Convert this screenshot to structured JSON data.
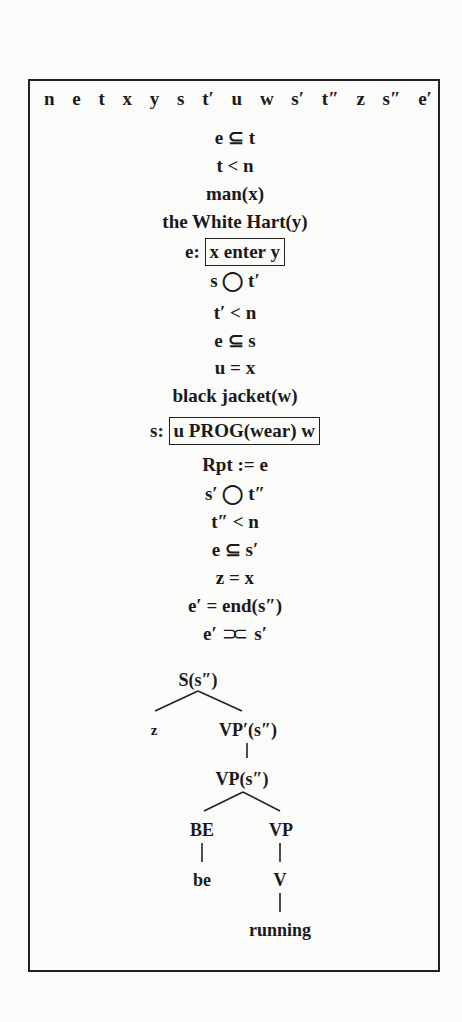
{
  "drs": {
    "universe": [
      "n",
      "e",
      "t",
      "x",
      "y",
      "s",
      "t′",
      "u",
      "w",
      "s′",
      "t″",
      "z",
      "s″",
      "e′"
    ],
    "conditions": [
      {
        "text": "e ⊆ t"
      },
      {
        "text": "t < n"
      },
      {
        "text": "man(x)"
      },
      {
        "text": "the White Hart(y)"
      },
      {
        "prefix": "e:",
        "boxed": "x enter y"
      },
      {
        "text": "s ◯ t′"
      },
      {
        "text": "t′ < n"
      },
      {
        "text": "e ⊆ s"
      },
      {
        "text": "u = x"
      },
      {
        "text": "black jacket(w)"
      },
      {
        "prefix": "s:",
        "boxed": "u PROG(wear) w"
      },
      {
        "text": "Rpt := e"
      },
      {
        "text": "s′ ◯ t″"
      },
      {
        "text": "t″ < n"
      },
      {
        "text": "e ⊆ s′"
      },
      {
        "text": "z = x"
      },
      {
        "text": "e′ = end(s″)"
      },
      {
        "left": "e′",
        "symbol": "⊃⊂",
        "right": "s′"
      }
    ],
    "tree": {
      "root": "S(s″)",
      "subject": "z",
      "vp_prime": "VP′(s″)",
      "vp": "VP(s″)",
      "be_cat": "BE",
      "be_word": "be",
      "vp_inner": "VP",
      "v_cat": "V",
      "v_word": "running"
    }
  }
}
